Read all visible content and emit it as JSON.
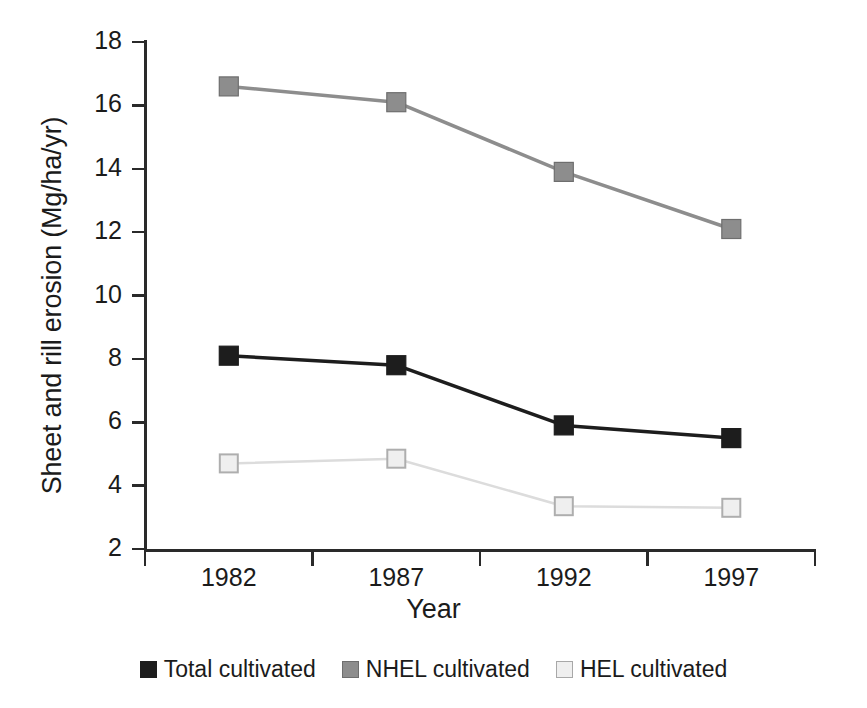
{
  "chart_data": {
    "type": "line",
    "title": "",
    "xlabel": "Year",
    "ylabel": "Sheet and rill erosion (Mg/ha/yr)",
    "categories": [
      "1982",
      "1987",
      "1992",
      "1997"
    ],
    "x": [
      1982,
      1987,
      1992,
      1997
    ],
    "ylim": [
      2,
      18
    ],
    "yticks": [
      2,
      4,
      6,
      8,
      10,
      12,
      14,
      16,
      18
    ],
    "ytick_labels": [
      "2",
      "4",
      "6",
      "8",
      "10",
      "12",
      "14",
      "16",
      "18"
    ],
    "grid": false,
    "legend_position": "bottom-center",
    "series": [
      {
        "name": "Total cultivated",
        "values": [
          8.1,
          7.8,
          5.9,
          5.5
        ],
        "color": "#1d1d1d",
        "marker": "filled-square",
        "marker_fill": "#1d1d1d",
        "marker_edge": "#1d1d1d",
        "line_width": 3.5
      },
      {
        "name": "NHEL cultivated",
        "values": [
          16.6,
          16.1,
          13.9,
          12.1
        ],
        "color": "#8d8d8d",
        "marker": "filled-square",
        "marker_fill": "#8d8d8d",
        "marker_edge": "#6e6e6e",
        "line_width": 3.5
      },
      {
        "name": "HEL cultivated",
        "values": [
          4.7,
          4.85,
          3.35,
          3.3
        ],
        "color": "#dcdcdc",
        "marker": "filled-square",
        "marker_fill": "#efefef",
        "marker_edge": "#aeaeae",
        "line_width": 2.5
      }
    ]
  },
  "axes": {
    "y_title": "Sheet and rill erosion (Mg/ha/yr)",
    "x_title": "Year",
    "y_ticks": [
      "18",
      "16",
      "14",
      "12",
      "10",
      "8",
      "6",
      "4",
      "2"
    ],
    "x_ticks": [
      "1982",
      "1987",
      "1992",
      "1997"
    ]
  },
  "legend": {
    "items": [
      {
        "label": "Total cultivated",
        "swatch": "#1d1d1d",
        "border": "#1d1d1d"
      },
      {
        "label": "NHEL cultivated",
        "swatch": "#8d8d8d",
        "border": "#6e6e6e"
      },
      {
        "label": "HEL cultivated",
        "swatch": "#efefef",
        "border": "#a8a8a8"
      }
    ]
  },
  "colors": {
    "axis": "#2a2a2a",
    "text": "#1b1b1b",
    "background": "#ffffff"
  }
}
